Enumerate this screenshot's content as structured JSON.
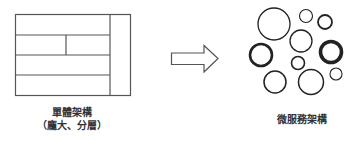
{
  "diagram": {
    "monolith": {
      "title": "單體架構",
      "subtitle": "（龐大、分層）",
      "stroke_color": "#555555"
    },
    "arrow": {
      "icon": "right-arrow-icon",
      "stroke_color": "#555555"
    },
    "microservices": {
      "title": "微服務架構",
      "stroke_color": "#222222",
      "circles": [
        {
          "cx": 274,
          "cy": 24,
          "r": 16,
          "w": 1.3
        },
        {
          "cx": 306,
          "cy": 16,
          "r": 6.5,
          "w": 1.1
        },
        {
          "cx": 325,
          "cy": 22,
          "r": 7,
          "w": 1.8
        },
        {
          "cx": 301,
          "cy": 41,
          "r": 11,
          "w": 1.3
        },
        {
          "cx": 261,
          "cy": 55,
          "r": 11,
          "w": 2.6
        },
        {
          "cx": 331,
          "cy": 52,
          "r": 10.5,
          "w": 3.6
        },
        {
          "cx": 298,
          "cy": 63,
          "r": 6.5,
          "w": 1.6
        },
        {
          "cx": 336,
          "cy": 74,
          "r": 6,
          "w": 1.1
        },
        {
          "cx": 275,
          "cy": 82,
          "r": 11,
          "w": 1.5
        },
        {
          "cx": 311,
          "cy": 82,
          "r": 12.5,
          "w": 1.5
        }
      ]
    }
  }
}
